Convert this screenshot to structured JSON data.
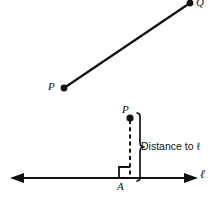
{
  "figure": {
    "background_color": "#ffffff",
    "stroke_color": "#111111",
    "top_diagram": {
      "name": "segment-pq",
      "point_p_label": "P",
      "point_q_label": "Q",
      "point_p": {
        "x": 64,
        "y": 88
      },
      "point_q": {
        "x": 190,
        "y": 3
      },
      "segment_width": 2.2,
      "dot_radius": 3.4
    },
    "bottom_diagram": {
      "name": "distance-point-to-line",
      "point_p_label": "P",
      "foot_label": "A",
      "line_label": "ℓ",
      "brace_label": "Distance to ℓ",
      "point_p": {
        "x": 130,
        "y": 118
      },
      "foot_a": {
        "x": 130,
        "y": 178
      },
      "line_y": 178,
      "line_x_start": 12,
      "line_x_end": 196,
      "perpendicular_style": "dashed",
      "right_angle_marker": true,
      "dot_radius": 3.6
    }
  }
}
